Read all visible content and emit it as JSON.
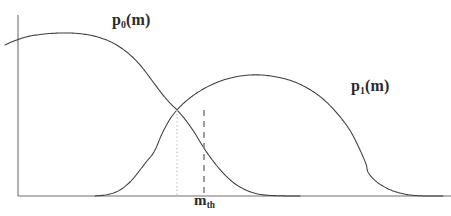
{
  "figure": {
    "title": "",
    "background_color": "#ffffff",
    "width": 451,
    "height": 216,
    "axis_color": "#6e6e6e",
    "curve_color": "#3d3d3d",
    "dotted_line_color": "#c9c9c9",
    "dashed_line_color": "#8c8c8c",
    "label_color": "#2b2b2b"
  },
  "labels": {
    "p0": {
      "base": "p",
      "sub": "0",
      "tail": "(m)",
      "full": "p0(m)"
    },
    "p1": {
      "base": "p",
      "sub": "1",
      "tail": "(m)",
      "full": "p1(m)"
    },
    "threshold": {
      "base": "m",
      "sub": "th",
      "tail": "",
      "full": "mth"
    }
  },
  "chart_data": {
    "type": "line",
    "title": "",
    "xlabel": "m",
    "ylabel": "",
    "grid": false,
    "legend": "inline-annotations",
    "axes": {
      "x_axis": {
        "visible": true,
        "y_pixel": 196,
        "x_start_pixel": 18,
        "x_end_pixel": 451
      },
      "y_axis": {
        "visible": true,
        "x_pixel": 18,
        "y_start_pixel": 15,
        "y_end_pixel": 196
      },
      "ticks": [],
      "tick_labels": []
    },
    "series": [
      {
        "name": "p0(m)",
        "label": "p0(m)",
        "style": "solid",
        "points": [
          [
            5,
            45
          ],
          [
            14,
            41
          ],
          [
            26,
            37
          ],
          [
            40,
            34.5
          ],
          [
            55,
            33.2
          ],
          [
            70,
            33.0
          ],
          [
            84,
            34.2
          ],
          [
            97,
            36.8
          ],
          [
            110,
            41.5
          ],
          [
            122,
            48.5
          ],
          [
            133,
            57.5
          ],
          [
            143,
            68.5
          ],
          [
            152,
            80.5
          ],
          [
            161,
            92.5
          ],
          [
            169,
            102.0
          ],
          [
            177,
            110.0
          ],
          [
            184,
            118.0
          ],
          [
            190,
            126.0
          ],
          [
            196,
            135.0
          ],
          [
            202,
            145.0
          ],
          [
            209,
            155.5
          ],
          [
            217,
            166.0
          ],
          [
            226,
            176.0
          ],
          [
            236,
            184.5
          ],
          [
            247,
            190.5
          ],
          [
            258,
            194.0
          ],
          [
            270,
            195.4
          ],
          [
            285,
            195.9
          ],
          [
            300,
            196.0
          ]
        ]
      },
      {
        "name": "p1(m)",
        "label": "p1(m)",
        "style": "solid",
        "points": [
          [
            95,
            196.0
          ],
          [
            108,
            194.5
          ],
          [
            120,
            190.0
          ],
          [
            131,
            181.0
          ],
          [
            140,
            170.0
          ],
          [
            147,
            161.0
          ],
          [
            152,
            155.0
          ],
          [
            156,
            148.0
          ],
          [
            161,
            136.0
          ],
          [
            166,
            126.0
          ],
          [
            171,
            117.5
          ],
          [
            177,
            110.0
          ],
          [
            185,
            102.0
          ],
          [
            196,
            93.5
          ],
          [
            209,
            86.0
          ],
          [
            222,
            80.5
          ],
          [
            236,
            76.8
          ],
          [
            250,
            75.0
          ],
          [
            264,
            75.2
          ],
          [
            278,
            77.2
          ],
          [
            292,
            81.0
          ],
          [
            305,
            86.8
          ],
          [
            318,
            95.0
          ],
          [
            330,
            105.5
          ],
          [
            341,
            118.0
          ],
          [
            351,
            132.0
          ],
          [
            360,
            150.0
          ],
          [
            366,
            164.0
          ],
          [
            368,
            172.0
          ],
          [
            374,
            179.5
          ],
          [
            382,
            185.5
          ],
          [
            392,
            190.5
          ],
          [
            403,
            193.8
          ],
          [
            414,
            195.4
          ],
          [
            427,
            196.0
          ],
          [
            443,
            196.0
          ]
        ]
      }
    ],
    "annotations": [
      {
        "name": "intersection-dotted-line",
        "kind": "vertical-line",
        "style": "dotted",
        "x_pixel": 177,
        "y_top_pixel": 110,
        "y_bottom_pixel": 196,
        "label": ""
      },
      {
        "name": "threshold-dashed-line",
        "kind": "vertical-line",
        "style": "dashed",
        "x_pixel": 204,
        "y_top_pixel": 110,
        "y_bottom_pixel": 196,
        "label": "mth"
      },
      {
        "name": "p0-curve-label",
        "kind": "text",
        "x_pixel": 112,
        "y_pixel": 12,
        "label": "p0(m)"
      },
      {
        "name": "p1-curve-label",
        "kind": "text",
        "x_pixel": 351,
        "y_pixel": 78,
        "label": "p1(m)"
      },
      {
        "name": "threshold-axis-label",
        "kind": "text",
        "x_pixel": 194,
        "y_pixel": 193,
        "label": "mth"
      }
    ]
  }
}
